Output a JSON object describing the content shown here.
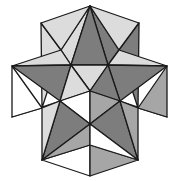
{
  "figure": {
    "shades": {
      "dark": "#7d7d7d",
      "mid": "#a6a6a6",
      "light": "#dcdcdc",
      "white": "#ffffff"
    },
    "edge_color": "#1a1a1a"
  },
  "facets": [
    {
      "name": "top-spike-left-face",
      "shade": "light"
    },
    {
      "name": "top-spike-right-face",
      "shade": "dark"
    },
    {
      "name": "top-spike-center-face",
      "shade": "dark"
    },
    {
      "name": "upper-left-spike-face",
      "shade": "light"
    },
    {
      "name": "upper-left-spike-inner-face",
      "shade": "light"
    },
    {
      "name": "upper-right-spike-face",
      "shade": "light"
    },
    {
      "name": "upper-right-spike-inner-face",
      "shade": "dark"
    },
    {
      "name": "left-spike-upper-face",
      "shade": "light"
    },
    {
      "name": "left-spike-lower-face",
      "shade": "dark"
    },
    {
      "name": "right-spike-upper-face",
      "shade": "light"
    },
    {
      "name": "right-spike-lower-face",
      "shade": "dark"
    },
    {
      "name": "center-top-face",
      "shade": "light"
    },
    {
      "name": "center-left-face",
      "shade": "light"
    },
    {
      "name": "center-right-face",
      "shade": "dark"
    },
    {
      "name": "lower-left-small-spike-face",
      "shade": "light"
    },
    {
      "name": "lower-left-small-spike-inner-face",
      "shade": "white"
    },
    {
      "name": "lower-right-small-spike-face",
      "shade": "dark"
    },
    {
      "name": "lower-right-small-spike-inner-face",
      "shade": "mid"
    },
    {
      "name": "center-lower-left-face",
      "shade": "white"
    },
    {
      "name": "center-lower-right-face",
      "shade": "mid"
    },
    {
      "name": "bottom-left-spike-face",
      "shade": "dark"
    },
    {
      "name": "bottom-left-spike-outer-face",
      "shade": "light"
    },
    {
      "name": "bottom-right-spike-face",
      "shade": "dark"
    },
    {
      "name": "bottom-right-spike-outer-face",
      "shade": "mid"
    },
    {
      "name": "bottom-spike-left-face",
      "shade": "white"
    },
    {
      "name": "bottom-spike-right-face",
      "shade": "mid"
    },
    {
      "name": "lower-center-left-face",
      "shade": "mid"
    },
    {
      "name": "lower-center-right-face",
      "shade": "white"
    }
  ]
}
